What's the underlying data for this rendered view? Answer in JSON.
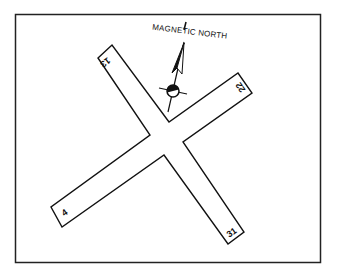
{
  "diagram": {
    "frame": {
      "x": 15,
      "y": 14,
      "width": 306,
      "height": 249,
      "stroke": "#222222"
    },
    "north_label": "MAGNETIC NORTH",
    "runways": [
      {
        "id": "runway-13-31",
        "ends": [
          "13",
          "31"
        ]
      },
      {
        "id": "runway-4-22",
        "ends": [
          "4",
          "22"
        ]
      }
    ],
    "runway_labels": {
      "r13": "13",
      "r31": "31",
      "r4": "4",
      "r22": "22"
    },
    "symbols": [
      "magnetic-north-arrow",
      "airport-wind-symbol"
    ],
    "colors": {
      "ink": "#111111",
      "background": "#ffffff"
    }
  }
}
